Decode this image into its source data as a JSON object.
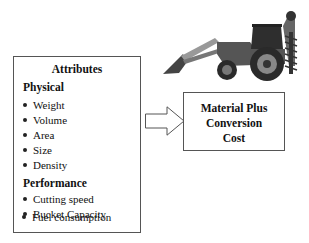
{
  "attributes_box": {
    "title": "Attributes",
    "sections": [
      {
        "heading": "Physical",
        "items": [
          "Weight",
          "Volume",
          "Area",
          "Size",
          "Density"
        ]
      },
      {
        "heading": "Performance",
        "items": [
          "Cutting speed",
          "Bucket Capacity",
          "Fuel consumption"
        ]
      }
    ]
  },
  "cost_box": {
    "lines": [
      "Material Plus",
      "Conversion",
      "Cost"
    ]
  },
  "arrow": {
    "direction": "right",
    "icon": "hollow-right-arrow"
  },
  "illustration": {
    "icon": "backhoe-tractor-with-auger"
  },
  "colors": {
    "border": "#555555",
    "text": "#111111",
    "machine": "#3a3a3a"
  }
}
